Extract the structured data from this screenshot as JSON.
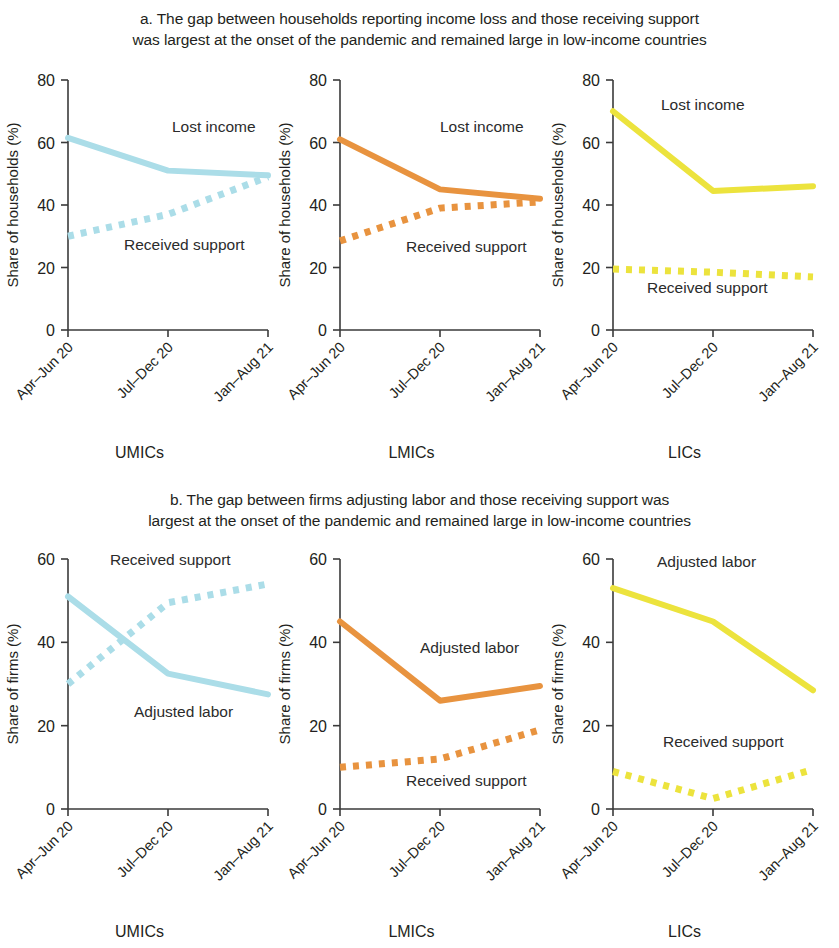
{
  "figure": {
    "title_a": "a. The gap between households reporting income loss and those receiving support was largest at the onset of the pandemic and remained large in low-income countries",
    "title_a_line1": "a. The gap between households reporting income loss and those receiving support",
    "title_a_line2": "was largest at the onset of the pandemic and remained large in low-income countries",
    "title_b_line1": "b. The gap between firms adjusting labor and those receiving support was",
    "title_b_line2": "largest at the onset of the pandemic and remained large in low-income countries",
    "group_labels": [
      "UMICs",
      "LMICs",
      "LICs"
    ],
    "colors": {
      "umics": "#abdde8",
      "lmics": "#e8933f",
      "lics": "#ece33d",
      "axis": "#3a3a3a",
      "text": "#231f20"
    }
  },
  "chart_data": [
    {
      "type": "line",
      "id": "a-umics",
      "panel": "a",
      "group": "UMICs",
      "title": "UMICs",
      "xlabel": "",
      "ylabel": "Share of households (%)",
      "categories": [
        "Apr–Jun 20",
        "Jul–Dec 20",
        "Jan–Aug 21"
      ],
      "ylim": [
        0,
        80
      ],
      "yticks": [
        0,
        20,
        40,
        60,
        80
      ],
      "grid": false,
      "legend_position": "inline-annotation",
      "color": "#abdde8",
      "series": [
        {
          "name": "Lost income",
          "values": [
            61.5,
            51.0,
            49.5
          ],
          "style": "solid",
          "label_x_frac": 0.52,
          "label_y_value": 63.5
        },
        {
          "name": "Received support",
          "values": [
            30.0,
            37.0,
            49.0
          ],
          "style": "dotted",
          "label_x_frac": 0.28,
          "label_y_value": 25.5
        }
      ]
    },
    {
      "type": "line",
      "id": "a-lmics",
      "panel": "a",
      "group": "LMICs",
      "title": "LMICs",
      "xlabel": "",
      "ylabel": "Share of households (%)",
      "categories": [
        "Apr–Jun 20",
        "Jul–Dec 20",
        "Jan–Aug 21"
      ],
      "ylim": [
        0,
        80
      ],
      "yticks": [
        0,
        20,
        40,
        60,
        80
      ],
      "grid": false,
      "legend_position": "inline-annotation",
      "color": "#e8933f",
      "series": [
        {
          "name": "Lost income",
          "values": [
            61.0,
            45.0,
            42.0
          ],
          "style": "solid",
          "label_x_frac": 0.5,
          "label_y_value": 63.5
        },
        {
          "name": "Received support",
          "values": [
            28.5,
            39.0,
            41.0
          ],
          "style": "dotted",
          "label_x_frac": 0.33,
          "label_y_value": 25.0
        }
      ]
    },
    {
      "type": "line",
      "id": "a-lics",
      "panel": "a",
      "group": "LICs",
      "title": "LICs",
      "xlabel": "",
      "ylabel": "Share of households (%)",
      "categories": [
        "Apr–Jun 20",
        "Jul–Dec 20",
        "Jan–Aug 21"
      ],
      "ylim": [
        0,
        80
      ],
      "yticks": [
        0,
        20,
        40,
        60,
        80
      ],
      "grid": false,
      "legend_position": "inline-annotation",
      "color": "#ece33d",
      "series": [
        {
          "name": "Lost income",
          "values": [
            70.0,
            44.5,
            46.0
          ],
          "style": "solid",
          "label_x_frac": 0.24,
          "label_y_value": 70.5
        },
        {
          "name": "Received support",
          "values": [
            19.5,
            18.5,
            17.0
          ],
          "style": "dotted",
          "label_x_frac": 0.17,
          "label_y_value": 12.0
        }
      ]
    },
    {
      "type": "line",
      "id": "b-umics",
      "panel": "b",
      "group": "UMICs",
      "title": "UMICs",
      "xlabel": "",
      "ylabel": "Share of firms (%)",
      "categories": [
        "Apr–Jun 20",
        "Jul–Dec 20",
        "Jan–Aug 21"
      ],
      "ylim": [
        0,
        60
      ],
      "yticks": [
        0,
        20,
        40,
        60
      ],
      "grid": false,
      "legend_position": "inline-annotation",
      "color": "#abdde8",
      "series": [
        {
          "name": "Received support",
          "values": [
            30.0,
            49.5,
            54.0
          ],
          "style": "dotted",
          "label_x_frac": 0.21,
          "label_y_value": 58.5
        },
        {
          "name": "Adjusted labor",
          "values": [
            51.0,
            32.5,
            27.5
          ],
          "style": "solid",
          "label_x_frac": 0.33,
          "label_y_value": 22.0
        }
      ]
    },
    {
      "type": "line",
      "id": "b-lmics",
      "panel": "b",
      "group": "LMICs",
      "title": "LMICs",
      "xlabel": "",
      "ylabel": "Share of firms (%)",
      "categories": [
        "Apr–Jun 20",
        "Jul–Dec 20",
        "Jan–Aug 21"
      ],
      "ylim": [
        0,
        60
      ],
      "yticks": [
        0,
        20,
        40,
        60
      ],
      "grid": false,
      "legend_position": "inline-annotation",
      "color": "#e8933f",
      "series": [
        {
          "name": "Adjusted labor",
          "values": [
            45.0,
            26.0,
            29.5
          ],
          "style": "solid",
          "label_x_frac": 0.4,
          "label_y_value": 37.5
        },
        {
          "name": "Received support",
          "values": [
            10.0,
            12.0,
            19.0
          ],
          "style": "dotted",
          "label_x_frac": 0.33,
          "label_y_value": 5.5
        }
      ]
    },
    {
      "type": "line",
      "id": "b-lics",
      "panel": "b",
      "group": "LICs",
      "title": "LICs",
      "xlabel": "",
      "ylabel": "Share of firms (%)",
      "categories": [
        "Apr–Jun 20",
        "Jul–Dec 20",
        "Jan–Aug 21"
      ],
      "ylim": [
        0,
        60
      ],
      "yticks": [
        0,
        20,
        40,
        60
      ],
      "grid": false,
      "legend_position": "inline-annotation",
      "color": "#ece33d",
      "series": [
        {
          "name": "Adjusted labor",
          "values": [
            53.0,
            45.0,
            28.5
          ],
          "style": "solid",
          "label_x_frac": 0.22,
          "label_y_value": 58.0
        },
        {
          "name": "Received support",
          "values": [
            9.0,
            2.5,
            9.5
          ],
          "style": "dotted",
          "label_x_frac": 0.25,
          "label_y_value": 15.0
        }
      ]
    }
  ]
}
